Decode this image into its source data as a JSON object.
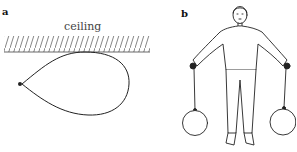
{
  "panels": [
    {
      "label": "a",
      "ceiling_label": "ceiling",
      "description": "Teardrop-shaped balloon pressed against the ceiling, tied at the left tip"
    },
    {
      "label": "b",
      "description": "Person standing with arms outstretched, holding two round balloons hanging below on strings"
    }
  ],
  "colors": {
    "stroke": "#222222",
    "hatch": "#555555",
    "background": "#ffffff"
  }
}
